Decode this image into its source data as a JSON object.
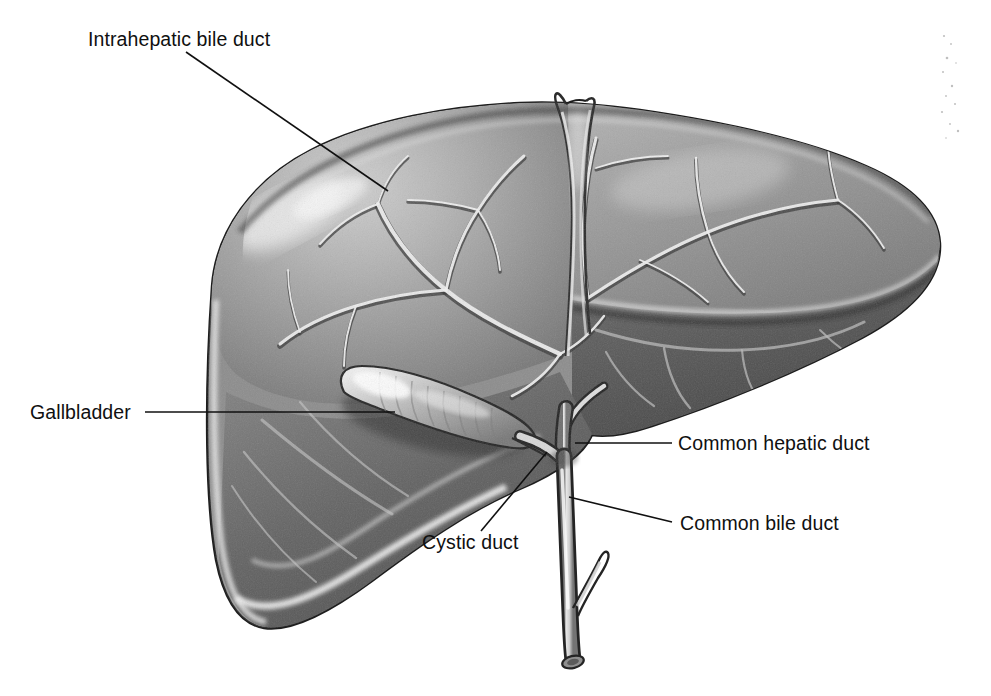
{
  "figure": {
    "background_color": "#ffffff",
    "ink_color": "#101010",
    "width": 991,
    "height": 696
  },
  "labels": {
    "intrahepatic_bile_duct": "Intrahepatic bile duct",
    "gallbladder": "Gallbladder",
    "cystic_duct": "Cystic duct",
    "common_hepatic_duct": "Common hepatic duct",
    "common_bile_duct": "Common bile duct"
  },
  "leader_lines": [
    {
      "name": "intrahepatic-bile-duct-leader",
      "from": [
        186,
        52
      ],
      "to": [
        388,
        191
      ]
    },
    {
      "name": "gallbladder-leader",
      "from": [
        145,
        412
      ],
      "to": [
        395,
        412
      ]
    },
    {
      "name": "cystic-duct-leader",
      "from": [
        481,
        531
      ],
      "to": [
        547,
        452
      ]
    },
    {
      "name": "common-hepatic-duct-leader",
      "from": [
        672,
        443
      ],
      "to": [
        575,
        443
      ]
    },
    {
      "name": "common-bile-duct-leader",
      "from": [
        672,
        522
      ],
      "to": [
        569,
        497
      ]
    }
  ],
  "structures": [
    {
      "name": "liver-left-lobe",
      "tone": "mid-gray"
    },
    {
      "name": "liver-right-lobe",
      "tone": "dark-gray"
    },
    {
      "name": "falciform-ligament",
      "tone": "highlight"
    },
    {
      "name": "gallbladder-body",
      "tone": "light-gray-striated"
    },
    {
      "name": "intrahepatic-duct-tree",
      "tone": "light-branching"
    },
    {
      "name": "common-hepatic-duct",
      "tone": "light-gray"
    },
    {
      "name": "cystic-duct",
      "tone": "light-gray"
    },
    {
      "name": "common-bile-duct",
      "tone": "light-gray"
    },
    {
      "name": "pancreatic-duct-stub",
      "tone": "light-gray"
    }
  ]
}
